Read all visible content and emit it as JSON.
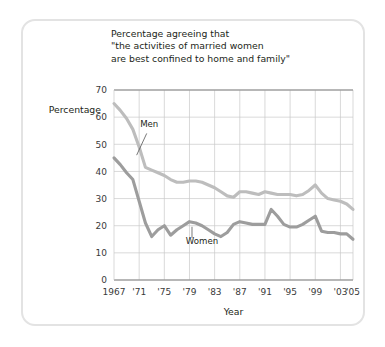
{
  "figure": {
    "frame_color": "#e3e3e3",
    "background": "#ffffff"
  },
  "chart_data": {
    "type": "line",
    "title_lines": [
      "Percentage agreeing that",
      "\"the activities of married women",
      "are best confined to home and family\""
    ],
    "xlabel": "Year",
    "ylabel": "Percentage",
    "xlim": [
      1967,
      2005
    ],
    "ylim": [
      0,
      70
    ],
    "ytick_values": [
      0,
      10,
      20,
      30,
      40,
      50,
      60,
      70
    ],
    "ytick_labels": [
      "0",
      "10",
      "20",
      "30",
      "40",
      "50",
      "60",
      "70"
    ],
    "xtick_values": [
      1967,
      1971,
      1975,
      1979,
      1983,
      1987,
      1991,
      1995,
      1999,
      2003,
      2005
    ],
    "xtick_labels": [
      "1967",
      "'71",
      "'75",
      "'79",
      "'83",
      "'87",
      "'91",
      "'95",
      "'99",
      "'03",
      "'05"
    ],
    "grid": true,
    "grid_color": "#c9c9c9",
    "legend": "inline-annotations",
    "series": [
      {
        "name": "Men",
        "color": "#bdbdbd",
        "label_x": 1972.6,
        "label_y": 56.5,
        "leader": {
          "x1": 1972.2,
          "y1": 54.0,
          "x2": 1970.6,
          "y2": 46.0
        },
        "x": [
          1967,
          1968,
          1969,
          1970,
          1971,
          1972,
          1973,
          1974,
          1975,
          1976,
          1977,
          1978,
          1979,
          1980,
          1981,
          1982,
          1983,
          1984,
          1985,
          1986,
          1987,
          1988,
          1989,
          1990,
          1991,
          1992,
          1993,
          1994,
          1995,
          1996,
          1997,
          1998,
          1999,
          2000,
          2001,
          2002,
          2003,
          2004,
          2005
        ],
        "y": [
          65,
          62.5,
          59.5,
          55.5,
          49,
          41.5,
          40.5,
          39.5,
          38.5,
          37,
          36,
          36,
          36.5,
          36.5,
          36,
          35,
          34,
          32.5,
          31,
          30.5,
          32.5,
          32.5,
          32,
          31.5,
          32.5,
          32,
          31.5,
          31.5,
          31.5,
          31,
          31.5,
          33,
          35,
          32,
          30,
          29.5,
          29,
          28,
          26
        ]
      },
      {
        "name": "Women",
        "color": "#9d9d9d",
        "label_x": 1981.0,
        "label_y": 13.3,
        "leader": {
          "x1": 1979.4,
          "y1": 15.5,
          "x2": 1979.4,
          "y2": 19.6
        },
        "x": [
          1967,
          1968,
          1969,
          1970,
          1971,
          1972,
          1973,
          1974,
          1975,
          1976,
          1977,
          1978,
          1979,
          1980,
          1981,
          1982,
          1983,
          1984,
          1985,
          1986,
          1987,
          1988,
          1989,
          1990,
          1991,
          1992,
          1993,
          1994,
          1995,
          1996,
          1997,
          1998,
          1999,
          2000,
          2001,
          2002,
          2003,
          2004,
          2005
        ],
        "y": [
          45,
          42.5,
          39.5,
          37,
          29,
          21,
          16,
          18.5,
          20,
          16.5,
          18.5,
          20,
          21.5,
          21,
          20,
          18.5,
          17,
          16,
          17.5,
          20.5,
          21.5,
          21,
          20.5,
          20.5,
          20.5,
          26,
          23.5,
          20.5,
          19.5,
          19.5,
          20.5,
          22,
          23.5,
          18,
          17.5,
          17.5,
          17,
          17,
          15
        ]
      }
    ]
  }
}
